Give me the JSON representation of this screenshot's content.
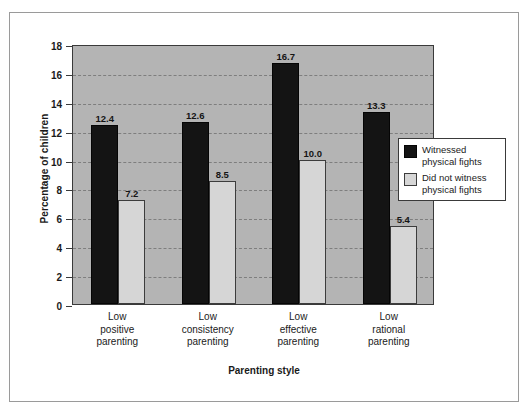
{
  "chart_data": {
    "type": "bar",
    "title": "",
    "xlabel": "Parenting style",
    "ylabel": "Percentage of children",
    "categories": [
      "Low\npositive\nparenting",
      "Low\nconsistency\nparenting",
      "Low\neffective\nparenting",
      "Low\nrational\nparenting"
    ],
    "series": [
      {
        "name": "Witnessed\nphysical fights",
        "color": "#141414",
        "values": [
          12.4,
          12.6,
          16.7,
          13.3
        ],
        "labels": [
          "12.4",
          "12.6",
          "16.7",
          "13.3"
        ]
      },
      {
        "name": "Did not witness\nphysical fights",
        "color": "#d6d6d6",
        "values": [
          7.2,
          8.5,
          10.0,
          5.4
        ],
        "labels": [
          "7.2",
          "8.5",
          "10.0",
          "5.4"
        ]
      }
    ],
    "ylim": [
      0,
      18
    ],
    "yticks": [
      0,
      2,
      4,
      6,
      8,
      10,
      12,
      14,
      16,
      18
    ],
    "ytick_labels": [
      "0",
      "2",
      "4",
      "6",
      "8",
      "10",
      "12",
      "14",
      "16",
      "18"
    ],
    "grid": true,
    "legend_position": "center-right",
    "plot_background": "#b4b4b4",
    "gridline_color": "#7e7e7e",
    "axis_color": "#3a3a3a",
    "frame_color": "#9a9a9a"
  },
  "legend": {
    "items": [
      {
        "label": "Witnessed\nphysical fights",
        "swatch": "dark"
      },
      {
        "label": "Did not witness\nphysical fights",
        "swatch": "light"
      }
    ]
  }
}
